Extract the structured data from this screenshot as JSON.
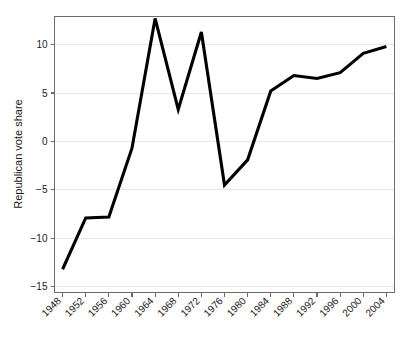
{
  "figure": {
    "background_color": "#ffffff",
    "frame_color": "#6b6b6b",
    "grid_color": "#e8e8e8",
    "line_color": "#000000"
  },
  "chart_data": {
    "type": "line",
    "title": "",
    "xlabel": "",
    "ylabel": "Republican vote share",
    "categories": [
      "1948",
      "1952",
      "1956",
      "1960",
      "1964",
      "1968",
      "1972",
      "1976",
      "1980",
      "1984",
      "1988",
      "1992",
      "1996",
      "2000",
      "2004"
    ],
    "x": [
      1948,
      1952,
      1956,
      1960,
      1964,
      1968,
      1972,
      1976,
      1980,
      1984,
      1988,
      1992,
      1996,
      2000,
      2004
    ],
    "values": [
      -13.2,
      -7.9,
      -7.8,
      -0.7,
      12.7,
      3.3,
      11.3,
      -4.5,
      -1.9,
      5.2,
      6.8,
      6.5,
      7.1,
      9.1,
      9.8
    ],
    "series": [
      {
        "name": "Republican vote share",
        "values": [
          -13.2,
          -7.9,
          -7.8,
          -0.7,
          12.7,
          3.3,
          11.3,
          -4.5,
          -1.9,
          5.2,
          6.8,
          6.5,
          7.1,
          9.1,
          9.8
        ]
      }
    ],
    "ylim": [
      -15.6,
      12.9
    ],
    "xlim": [
      1946.6,
      2005.4
    ],
    "yticks": [
      10,
      5,
      0,
      -5,
      -10,
      -15
    ],
    "ytick_labels": [
      "10",
      "5",
      "0",
      "−5",
      "−10",
      "−15"
    ],
    "xtick_labels": [
      "1948",
      "1952",
      "1956",
      "1960",
      "1964",
      "1968",
      "1972",
      "1976",
      "1980",
      "1984",
      "1988",
      "1992",
      "1996",
      "2000",
      "2004"
    ],
    "xtick_rotation": 45,
    "grid": "horizontal",
    "legend": "none"
  }
}
